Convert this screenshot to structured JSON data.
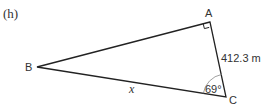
{
  "part_label": "(h)",
  "vertices": {
    "A": {
      "label": "A",
      "x": 210,
      "y": 22
    },
    "B": {
      "label": "B",
      "x": 37,
      "y": 67
    },
    "C": {
      "label": "C",
      "x": 226,
      "y": 97
    }
  },
  "side_AC_label": "412.3 m",
  "side_BC_label": "x",
  "angle_C_label": "69°",
  "right_angle_at": "A",
  "colors": {
    "stroke": "#222222",
    "text": "#333333",
    "arc": "#888888"
  }
}
